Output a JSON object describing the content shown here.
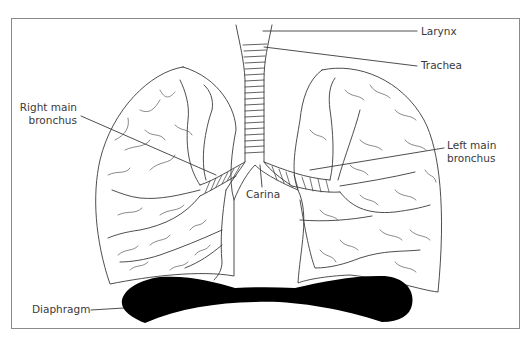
{
  "diagram": {
    "frame_color": "#8a8a8a",
    "line_color": "#3a3a3a",
    "diaphragm_color": "#000000",
    "labels": {
      "larynx": "Larynx",
      "trachea": "Trachea",
      "right_main_bronchus_line1": "Right main",
      "right_main_bronchus_line2": "bronchus",
      "left_main_bronchus_line1": "Left main",
      "left_main_bronchus_line2": "bronchus",
      "carina": "Carina",
      "diaphragm": "Diaphragm"
    },
    "nodes": [
      {
        "id": "larynx",
        "label": "Larynx"
      },
      {
        "id": "trachea",
        "label": "Trachea"
      },
      {
        "id": "carina",
        "label": "Carina"
      },
      {
        "id": "right_main_bronchus",
        "label": "Right main bronchus"
      },
      {
        "id": "left_main_bronchus",
        "label": "Left main bronchus"
      },
      {
        "id": "diaphragm",
        "label": "Diaphragm"
      }
    ],
    "edges": [
      {
        "from": "larynx",
        "to": "trachea"
      },
      {
        "from": "trachea",
        "to": "carina"
      },
      {
        "from": "carina",
        "to": "right_main_bronchus"
      },
      {
        "from": "carina",
        "to": "left_main_bronchus"
      }
    ]
  }
}
